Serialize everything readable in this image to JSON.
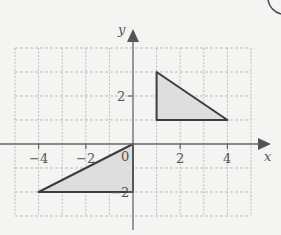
{
  "diagram": {
    "type": "coordinate-grid",
    "axes": {
      "x_label": "x",
      "y_label": "y",
      "x_range": [
        -5,
        5
      ],
      "y_range": [
        -3,
        4
      ],
      "x_ticks": [
        {
          "value": -4,
          "label": "−4"
        },
        {
          "value": -2,
          "label": "−2"
        },
        {
          "value": 0,
          "label": "0"
        },
        {
          "value": 2,
          "label": "2"
        },
        {
          "value": 4,
          "label": "4"
        }
      ],
      "y_ticks": [
        {
          "value": 2,
          "label": "2"
        },
        {
          "value": -2,
          "label": "−2"
        }
      ]
    },
    "shapes": [
      {
        "name": "triangle-a",
        "vertices": [
          [
            1,
            3
          ],
          [
            1,
            1
          ],
          [
            4,
            1
          ]
        ],
        "fill": "#dcdcdc",
        "stroke": "#444"
      },
      {
        "name": "triangle-b",
        "vertices": [
          [
            0,
            0
          ],
          [
            0,
            -2
          ],
          [
            -4,
            -2
          ]
        ],
        "fill": "#dcdcdc",
        "stroke": "#444"
      }
    ],
    "colors": {
      "background": "#f4f4f2",
      "grid": "#b8b8b8",
      "axis": "#555555"
    }
  }
}
